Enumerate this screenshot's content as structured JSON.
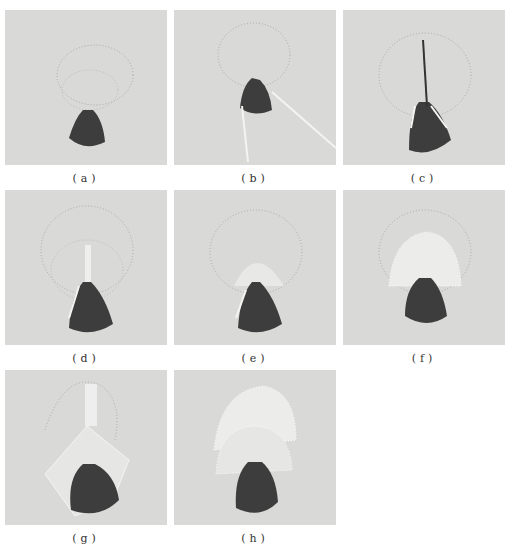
{
  "panels": [
    {
      "label": "(a)",
      "x": 5,
      "y": 10,
      "stage": "outline-only"
    },
    {
      "label": "(b)",
      "x": 174,
      "y": 10,
      "stage": "needle-insert"
    },
    {
      "label": "(c)",
      "x": 343,
      "y": 10,
      "stage": "first-stitch-vertical"
    },
    {
      "label": "(d)",
      "x": 5,
      "y": 190,
      "stage": "fan-start"
    },
    {
      "label": "(e)",
      "x": 174,
      "y": 190,
      "stage": "fan-progress"
    },
    {
      "label": "(f)",
      "x": 343,
      "y": 190,
      "stage": "inner-layer-complete"
    },
    {
      "label": "(g)",
      "x": 5,
      "y": 370,
      "stage": "outer-layer-start"
    },
    {
      "label": "(h)",
      "x": 174,
      "y": 370,
      "stage": "outer-layer-complete"
    }
  ],
  "colors": {
    "fabric": "#d9d9d7",
    "thread_dark": "#3d3d3d",
    "thread_light": "#f0f0ee"
  }
}
